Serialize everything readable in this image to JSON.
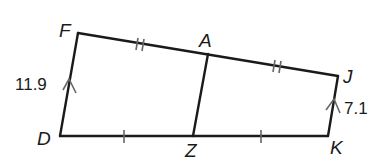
{
  "diagram": {
    "type": "quadrilateral-with-midsegment",
    "vertices": {
      "F": {
        "label": "F"
      },
      "A": {
        "label": "A"
      },
      "J": {
        "label": "J"
      },
      "K": {
        "label": "K"
      },
      "Z": {
        "label": "Z"
      },
      "D": {
        "label": "D"
      }
    },
    "segments": [
      {
        "from": "D",
        "to": "F",
        "marker": "parallel-arrow",
        "length_label": "11.9"
      },
      {
        "from": "F",
        "to": "A",
        "marker": "double-tick"
      },
      {
        "from": "A",
        "to": "J",
        "marker": "double-tick"
      },
      {
        "from": "J",
        "to": "K",
        "marker": "parallel-arrow",
        "length_label": "7.1"
      },
      {
        "from": "K",
        "to": "Z",
        "marker": "single-tick"
      },
      {
        "from": "Z",
        "to": "D",
        "marker": "single-tick"
      },
      {
        "from": "A",
        "to": "Z",
        "marker": "none"
      }
    ],
    "measurements": {
      "DF": "11.9",
      "JK": "7.1"
    }
  }
}
